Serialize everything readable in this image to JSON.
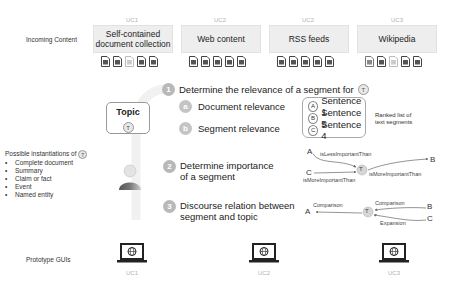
{
  "rows": {
    "incoming_content": "Incoming Content",
    "prototype_guis": "Prototype GUIs"
  },
  "sources": [
    {
      "uc": "UC1",
      "label": "Self-contained document collection",
      "line1": "Self-contained",
      "line2": "document collection"
    },
    {
      "uc": "UC2",
      "label": "Web content"
    },
    {
      "uc": "UC2",
      "label": "RSS feeds"
    },
    {
      "uc": "UC3",
      "label": "Wikipedia"
    }
  ],
  "topic": {
    "title": "Topic",
    "symbol": "T"
  },
  "instantiations": {
    "heading": "Possible instantiations of",
    "symbol": "T",
    "items": [
      "Complete document",
      "Summary",
      "Claim or fact",
      "Event",
      "Named entity"
    ]
  },
  "steps": [
    {
      "num": "1",
      "text": "Determine the relevance of a segment for",
      "symbol": "T"
    },
    {
      "num": "2",
      "line1": "Determine importance",
      "line2": "of a segment"
    },
    {
      "num": "3",
      "line1": "Discourse relation between",
      "line2": "segment and topic"
    }
  ],
  "substeps": [
    {
      "letter": "a",
      "text": "Document relevance"
    },
    {
      "letter": "b",
      "text": "Segment relevance"
    }
  ],
  "ranked": {
    "items": [
      {
        "letter": "A",
        "text": "Sentence 1"
      },
      {
        "letter": "B",
        "text": "Sentence 5"
      },
      {
        "letter": "C",
        "text": "Sentence 4"
      }
    ],
    "caption_line1": "Ranked list of",
    "caption_line2": "text segments"
  },
  "importance_graph": {
    "center": "T",
    "nodes": [
      "A",
      "B",
      "C"
    ],
    "edges": [
      {
        "from": "A",
        "to": "T",
        "label": "isLessImportantThan"
      },
      {
        "from": "C",
        "to": "T",
        "label": "isMoreImportantThan"
      },
      {
        "from": "T",
        "to": "B",
        "label": "isMoreImportantThan"
      }
    ]
  },
  "discourse_graph": {
    "center": "T",
    "nodes": [
      "A",
      "B",
      "C"
    ],
    "edges": [
      {
        "from": "T",
        "to": "A",
        "label": "Comparison"
      },
      {
        "from": "B",
        "to": "T",
        "label": "Comparison"
      },
      {
        "from": "C",
        "to": "T",
        "label": "Expansion"
      }
    ]
  },
  "guis": [
    {
      "uc": "UC1"
    },
    {
      "uc": "UC2"
    },
    {
      "uc": "UC3"
    }
  ]
}
